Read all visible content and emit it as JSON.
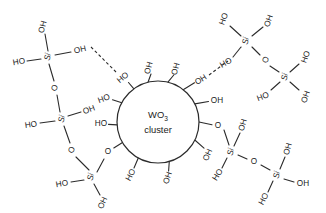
{
  "figure": {
    "type": "chemical-structure-diagram",
    "background_color": "#ffffff",
    "line_color": "#2b2b2b",
    "width": 326,
    "height": 213
  },
  "cluster": {
    "name": "core-cluster",
    "label_main": "WO",
    "label_sub": "3",
    "label_second_line": "cluster",
    "center_x": 158,
    "center_y": 122,
    "radius": 41
  },
  "cluster_groups": [
    {
      "label": "OH",
      "angle_deg": -104,
      "x": 149,
      "y": 68
    },
    {
      "label": "OH",
      "angle_deg": -76,
      "x": 176,
      "y": 69
    },
    {
      "label": "HO",
      "angle_deg": -126,
      "x": 123,
      "y": 78
    },
    {
      "label": "OH",
      "angle_deg": -52,
      "x": 201,
      "y": 80
    },
    {
      "label": "HO",
      "angle_deg": -152,
      "x": 104,
      "y": 99
    },
    {
      "label": "OH",
      "angle_deg": -26,
      "x": 217,
      "y": 101
    },
    {
      "label": "HO",
      "angle_deg": 176,
      "x": 101,
      "y": 124
    },
    {
      "label": "O",
      "angle_deg": 0,
      "x": 218,
      "y": 126
    },
    {
      "label": "O",
      "angle_deg": 150,
      "x": 108,
      "y": 152
    },
    {
      "label": "OH",
      "angle_deg": 26,
      "x": 208,
      "y": 155
    },
    {
      "label": "HO",
      "angle_deg": 118,
      "x": 131,
      "y": 175
    },
    {
      "label": "OH",
      "angle_deg": 74,
      "x": 168,
      "y": 178
    }
  ],
  "silicon_centers": [
    {
      "name": "si-top-left",
      "x": 48,
      "y": 57,
      "label": "Si",
      "substituents": [
        {
          "label": "OH",
          "x": 43,
          "y": 27
        },
        {
          "label": "HO",
          "x": 19,
          "y": 62
        },
        {
          "label": "OH",
          "x": 80,
          "y": 50
        },
        {
          "label": "O",
          "x": 55,
          "y": 88
        }
      ]
    },
    {
      "name": "si-mid-left",
      "x": 62,
      "y": 119,
      "label": "Si",
      "substituents": [
        {
          "label": "OH",
          "x": 89,
          "y": 110
        },
        {
          "label": "HO",
          "x": 31,
          "y": 125
        },
        {
          "label": "O",
          "x": 72,
          "y": 150
        }
      ]
    },
    {
      "name": "si-bottom-left",
      "x": 91,
      "y": 177,
      "label": "Si",
      "substituents": [
        {
          "label": "HO",
          "x": 62,
          "y": 184
        },
        {
          "label": "OH",
          "x": 103,
          "y": 203
        }
      ]
    },
    {
      "name": "si-top-right",
      "x": 246,
      "y": 41,
      "label": "Si",
      "substituents": [
        {
          "label": "HO",
          "x": 224,
          "y": 19
        },
        {
          "label": "OH",
          "x": 269,
          "y": 21
        },
        {
          "label": "HO",
          "x": 226,
          "y": 63
        },
        {
          "label": "O",
          "x": 266,
          "y": 60
        }
      ]
    },
    {
      "name": "si-far-right",
      "x": 285,
      "y": 77,
      "label": "Si",
      "substituents": [
        {
          "label": "HO",
          "x": 306,
          "y": 57
        },
        {
          "label": "HO",
          "x": 263,
          "y": 97
        },
        {
          "label": "OH",
          "x": 306,
          "y": 97
        }
      ]
    },
    {
      "name": "si-bottom-right-inner",
      "x": 231,
      "y": 152,
      "label": "Si",
      "substituents": [
        {
          "label": "OH",
          "x": 243,
          "y": 125
        },
        {
          "label": "HO",
          "x": 218,
          "y": 175
        },
        {
          "label": "O",
          "x": 254,
          "y": 162
        }
      ]
    },
    {
      "name": "si-bottom-right-outer",
      "x": 277,
      "y": 175,
      "label": "Si",
      "substituents": [
        {
          "label": "OH",
          "x": 288,
          "y": 149
        },
        {
          "label": "HO",
          "x": 264,
          "y": 199
        },
        {
          "label": "OH",
          "x": 303,
          "y": 184
        }
      ]
    }
  ],
  "hydrogen_bonds": [
    {
      "name": "hbond-left",
      "from_label": "OH",
      "to_label": "HO",
      "x1": 93,
      "y1": 46,
      "x2": 117,
      "y2": 74
    },
    {
      "name": "hbond-right",
      "from_label": "OH",
      "to_label": "HO",
      "x1": 208,
      "y1": 76,
      "x2": 227,
      "y2": 60
    }
  ]
}
